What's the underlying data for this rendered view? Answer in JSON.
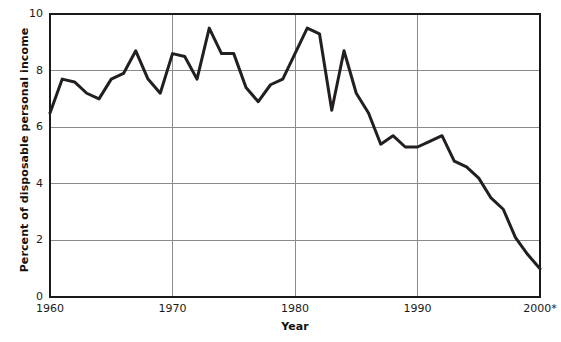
{
  "chart_data": {
    "type": "line",
    "title": "",
    "xlabel": "Year",
    "ylabel": "Percent of disposable personal income",
    "xlim": [
      1960,
      2000
    ],
    "ylim": [
      0,
      10
    ],
    "grid": true,
    "legend": "none",
    "x_tick_labels": [
      "1960",
      "1970",
      "1980",
      "1990",
      "2000*"
    ],
    "x_tick_values": [
      1960,
      1970,
      1980,
      1990,
      2000
    ],
    "y_tick_labels": [
      "0",
      "2",
      "4",
      "6",
      "8",
      "10"
    ],
    "y_tick_values": [
      0,
      2,
      4,
      6,
      8,
      10
    ],
    "series": [
      {
        "name": "Personal saving rate",
        "color": "#231f20",
        "x": [
          1960,
          1961,
          1962,
          1963,
          1964,
          1965,
          1966,
          1967,
          1968,
          1969,
          1970,
          1971,
          1972,
          1973,
          1974,
          1975,
          1976,
          1977,
          1978,
          1979,
          1980,
          1981,
          1982,
          1983,
          1984,
          1985,
          1986,
          1987,
          1988,
          1989,
          1990,
          1991,
          1992,
          1993,
          1994,
          1995,
          1996,
          1997,
          1998,
          1999,
          2000
        ],
        "values": [
          6.5,
          7.7,
          7.6,
          7.2,
          7.0,
          7.7,
          7.9,
          8.7,
          7.7,
          7.2,
          8.6,
          8.5,
          7.7,
          9.5,
          8.6,
          8.6,
          7.4,
          6.9,
          7.5,
          7.7,
          8.6,
          9.5,
          9.3,
          6.6,
          8.7,
          7.2,
          6.5,
          5.4,
          5.7,
          5.3,
          5.3,
          5.5,
          5.7,
          4.8,
          4.6,
          4.2,
          3.5,
          3.1,
          2.1,
          1.5,
          1.0
        ]
      }
    ],
    "annotations": []
  },
  "axes": {
    "x_title": "Year",
    "y_title": "Percent of disposable personal income"
  }
}
